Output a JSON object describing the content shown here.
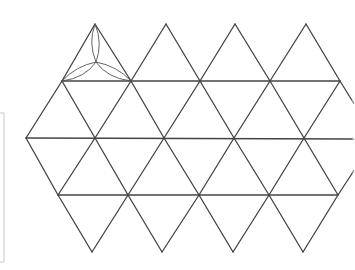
{
  "diagram": {
    "title": "",
    "colors": {
      "line": "#444444",
      "arc": "#555555",
      "frame": "#c8c8c8",
      "background": "#ffffff"
    },
    "rows": {
      "top_apex_y": 24,
      "row1_y": 81,
      "row2_y": 138,
      "row3_y": 195,
      "bottom_apex_y": 252
    },
    "top_apices_x": [
      95,
      166,
      235,
      306
    ],
    "row1_vertices_x": [
      62,
      131,
      200,
      270,
      340
    ],
    "row2_vertices_x": [
      26,
      95,
      164,
      234,
      304
    ],
    "row3_vertices_x": [
      58,
      128,
      199,
      269,
      338
    ],
    "bottom_apices_x": [
      92,
      162,
      233,
      303
    ],
    "petal_triangle": {
      "apex": [
        95,
        24
      ],
      "left": [
        62,
        81
      ],
      "right": [
        131,
        81
      ],
      "center": [
        96,
        62
      ]
    },
    "left_frame": {
      "x": 4,
      "y_top": 113,
      "y_bottom": 262
    }
  }
}
